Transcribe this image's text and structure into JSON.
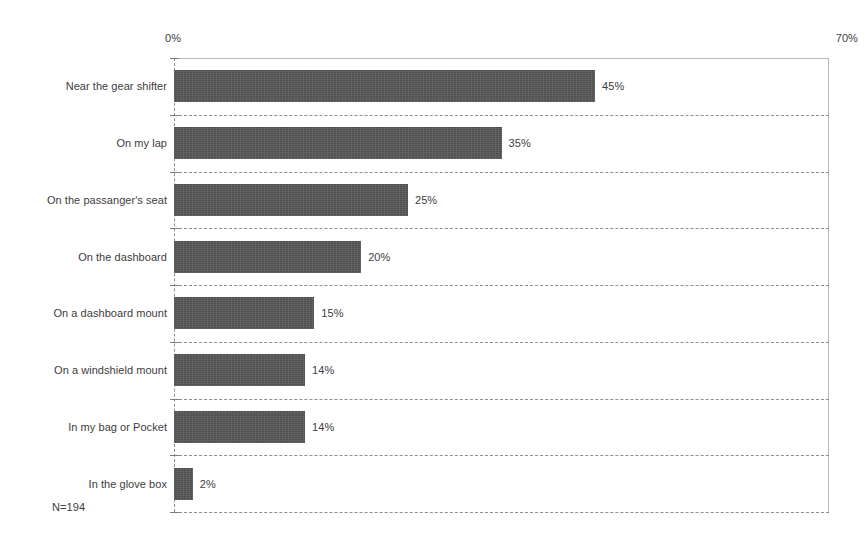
{
  "chart_data": {
    "type": "bar",
    "orientation": "horizontal",
    "title": "",
    "subtitle": "",
    "xlabel": "",
    "ylabel": "",
    "xlim": [
      0,
      70
    ],
    "x_tick_labels": [
      "0%",
      "70%"
    ],
    "x_ticks": [
      0,
      70
    ],
    "grid": "horizontal-dashed",
    "legend": "none",
    "value_label_suffix": "%",
    "categories": [
      "Near the gear shifter",
      "On my lap",
      "On the passanger's seat",
      "On the dashboard",
      "On a dashboard mount",
      "On a windshield mount",
      "In my bag or Pocket",
      "In the glove box"
    ],
    "values": [
      45,
      35,
      25,
      20,
      15,
      14,
      14,
      2
    ],
    "value_labels": [
      "45%",
      "35%",
      "25%",
      "20%",
      "15%",
      "14%",
      "14%",
      "2%"
    ],
    "annotations": [
      "N=194"
    ],
    "bar_color": "#575757",
    "gridline_color": "#8f8f8f",
    "axis_color": "#b9b9b9",
    "background_color": "#ffffff"
  },
  "axis": {
    "min_label": "0%",
    "max_label": "70%"
  },
  "footnote": {
    "sample_size": "N=194"
  }
}
